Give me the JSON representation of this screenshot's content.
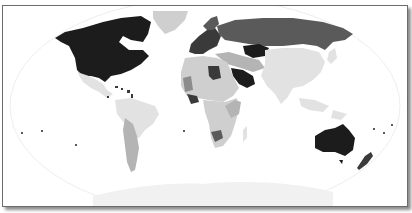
{
  "map": {
    "title": "",
    "title_clipped": true,
    "projection": "Robinson",
    "style": "grayscale choropleth",
    "legend": null
  },
  "colors": {
    "background": "#ffffff",
    "frame_border": "#6b6b6b",
    "ocean_outline": "#eeeeee",
    "shade_darkest": "#1c1c1c",
    "shade_dark": "#3a3a3a",
    "shade_mid_dark": "#5a5a5a",
    "shade_mid": "#8c8c8c",
    "shade_light": "#b4b4b4",
    "shade_lighter": "#cfcfcf",
    "shade_lightest": "#e2e2e2",
    "antarctica": "#f1f1f1"
  },
  "regions": [
    {
      "name": "North America (USA/Canada)",
      "shade": "darkest"
    },
    {
      "name": "Greenland",
      "shade": "lighter"
    },
    {
      "name": "Mexico & Central America",
      "shade": "lightest"
    },
    {
      "name": "Caribbean",
      "shade": "dark"
    },
    {
      "name": "South America (north/Brazil)",
      "shade": "lightest"
    },
    {
      "name": "South America (Chile/Argentina)",
      "shade": "light"
    },
    {
      "name": "Western Europe",
      "shade": "dark"
    },
    {
      "name": "Russia",
      "shade": "mid_dark"
    },
    {
      "name": "Kazakhstan",
      "shade": "darkest"
    },
    {
      "name": "Saudi Arabia",
      "shade": "darkest"
    },
    {
      "name": "North Africa",
      "shade": "lighter"
    },
    {
      "name": "Libya",
      "shade": "dark"
    },
    {
      "name": "Central/Southern Africa",
      "shade": "lighter"
    },
    {
      "name": "Southern Africa (Botswana)",
      "shade": "mid_dark"
    },
    {
      "name": "China & South Asia",
      "shade": "lightest"
    },
    {
      "name": "Southeast Asia",
      "shade": "lightest"
    },
    {
      "name": "Australia",
      "shade": "darkest"
    },
    {
      "name": "New Zealand",
      "shade": "dark"
    },
    {
      "name": "Antarctica",
      "shade": "antarctica"
    }
  ]
}
